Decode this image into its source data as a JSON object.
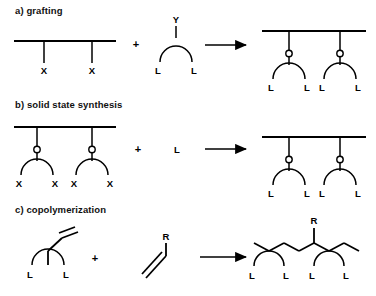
{
  "figure": {
    "kind": "chemical-reaction-scheme",
    "background_color": "#ffffff",
    "ink_color": "#000000",
    "sections": [
      {
        "id": "a",
        "heading": "a) grafting",
        "plus": "+",
        "arrow": "→",
        "reactant_labels": [
          "X",
          "X"
        ],
        "ligand_top_label": "Y",
        "ligand_labels": [
          "L",
          "L"
        ],
        "product_labels": [
          "L",
          "L",
          "L",
          "L"
        ]
      },
      {
        "id": "b",
        "heading": "b) solid state synthesis",
        "plus": "+",
        "arrow": "→",
        "reactant_labels": [
          "X",
          "X",
          "X",
          "X"
        ],
        "added_reagent": "L",
        "product_labels": [
          "L",
          "L",
          "L",
          "L"
        ]
      },
      {
        "id": "c",
        "heading": "c) copolymerization",
        "plus": "+",
        "arrow": "→",
        "reactant_labels": [
          "L",
          "L"
        ],
        "monomer_label": "R",
        "product_branch_label": "R",
        "product_labels": [
          "L",
          "L",
          "L",
          "L"
        ]
      }
    ]
  }
}
